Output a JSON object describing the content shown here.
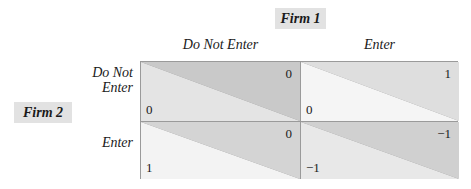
{
  "players": {
    "column_player": "Firm 1",
    "row_player": "Firm 2"
  },
  "column_strategies": [
    "Do Not Enter",
    "Enter"
  ],
  "row_strategies": [
    {
      "line1": "Do Not",
      "line2": "Enter"
    },
    {
      "line1": "Enter",
      "line2": ""
    }
  ],
  "cells": [
    [
      {
        "firm1_payoff": "0",
        "firm2_payoff": "0",
        "upper_color": "#c9c9c9",
        "lower_color": "#e4e4e4"
      },
      {
        "firm1_payoff": "1",
        "firm2_payoff": "0",
        "upper_color": "#dedede",
        "lower_color": "#f5f5f5"
      }
    ],
    [
      {
        "firm1_payoff": "0",
        "firm2_payoff": "1",
        "upper_color": "#d4d4d4",
        "lower_color": "#f3f3f3"
      },
      {
        "firm1_payoff": "−1",
        "firm2_payoff": "−1",
        "upper_color": "#d0d0d0",
        "lower_color": "#e8e8e8"
      }
    ]
  ],
  "colors": {
    "player_box": "#e2e2e2",
    "grid_line": "#9a9a9a"
  }
}
